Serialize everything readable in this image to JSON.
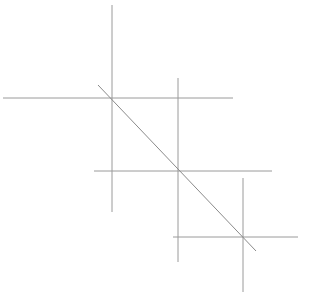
{
  "figure": {
    "name": "geometric-line-diagram",
    "width": 310,
    "height": 299,
    "background_color": "#ffffff",
    "stroke_color": "#9a9a9a",
    "diagonal_stroke_color": "#8a8a8a",
    "stroke_width": 1,
    "elements": [
      {
        "id": "top-left-vertical",
        "name": "vertical-line-top-left",
        "type": "line",
        "x1": 112,
        "y1": 5,
        "x2": 112,
        "y2": 212,
        "orientation": "vertical"
      },
      {
        "id": "top-horizontal",
        "name": "horizontal-line-top",
        "type": "line",
        "x1": 3,
        "y1": 98,
        "x2": 233,
        "y2": 98,
        "orientation": "horizontal"
      },
      {
        "id": "center-vertical",
        "name": "vertical-line-center",
        "type": "line",
        "x1": 178,
        "y1": 78,
        "x2": 178,
        "y2": 262,
        "orientation": "vertical"
      },
      {
        "id": "middle-horizontal",
        "name": "horizontal-line-middle",
        "type": "line",
        "x1": 94,
        "y1": 171,
        "x2": 272,
        "y2": 171,
        "orientation": "horizontal"
      },
      {
        "id": "bottom-right-vertical",
        "name": "vertical-line-bottom-right",
        "type": "line",
        "x1": 243,
        "y1": 178,
        "x2": 243,
        "y2": 292,
        "orientation": "vertical"
      },
      {
        "id": "bottom-horizontal",
        "name": "horizontal-line-bottom",
        "type": "line",
        "x1": 173,
        "y1": 237,
        "x2": 298,
        "y2": 237,
        "orientation": "horizontal"
      },
      {
        "id": "diagonal",
        "name": "diagonal-line",
        "type": "line",
        "x1": 98,
        "y1": 85,
        "x2": 256,
        "y2": 251,
        "orientation": "diagonal-descending"
      }
    ],
    "intersections": [
      {
        "id": "node-1",
        "name": "crosshair-upper-left",
        "x": 112,
        "y": 98
      },
      {
        "id": "node-2",
        "name": "crosshair-center",
        "x": 178,
        "y": 171
      },
      {
        "id": "node-3",
        "name": "crosshair-lower-right",
        "x": 243,
        "y": 237
      }
    ]
  }
}
